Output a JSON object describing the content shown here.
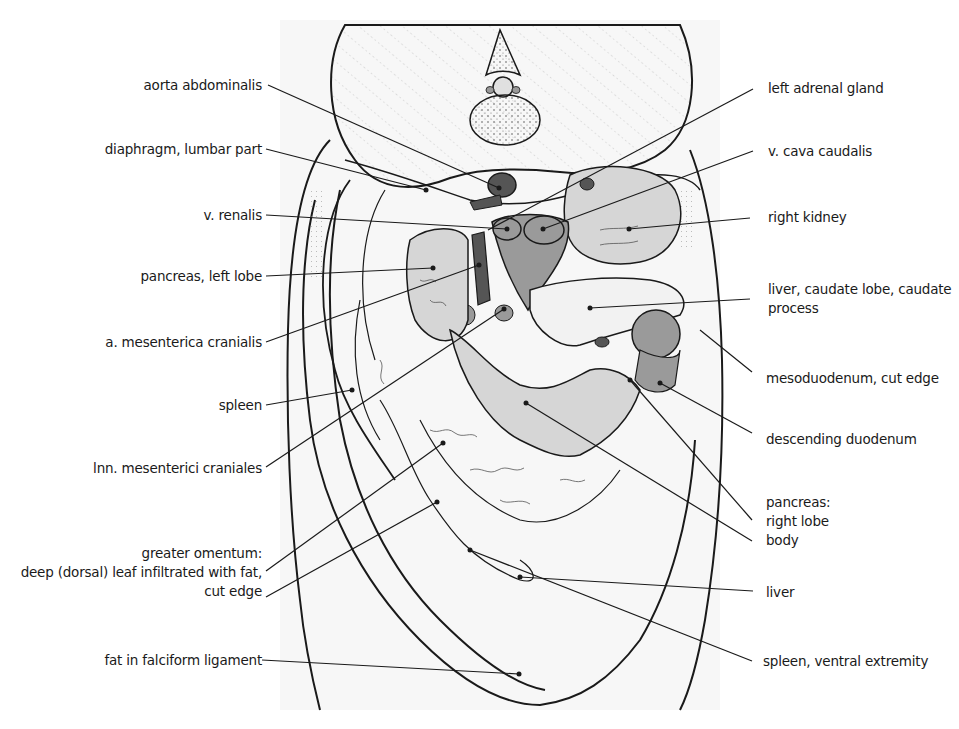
{
  "figure": {
    "type": "anatomical-illustration",
    "colors": {
      "background": "#ffffff",
      "outline": "#1a1a1a",
      "light_organ": "#d6d6d6",
      "mid_organ": "#9a9a9a",
      "dark_vessel": "#555555",
      "leader_line": "#1a1a1a"
    }
  },
  "labels_left": [
    {
      "id": "aorta-abdominalis",
      "lines": [
        "aorta abdominalis"
      ]
    },
    {
      "id": "diaphragm-lumbar-part",
      "lines": [
        "diaphragm, lumbar part"
      ]
    },
    {
      "id": "v-renalis",
      "lines": [
        "v. renalis"
      ]
    },
    {
      "id": "pancreas-left-lobe",
      "lines": [
        "pancreas, left lobe"
      ]
    },
    {
      "id": "a-mesenterica-cranialis",
      "lines": [
        "a. mesenterica cranialis"
      ]
    },
    {
      "id": "spleen",
      "lines": [
        "spleen"
      ]
    },
    {
      "id": "lnn-mesenterici-craniales",
      "lines": [
        "lnn. mesenterici craniales"
      ]
    },
    {
      "id": "greater-omentum",
      "lines": [
        "greater omentum:",
        "deep (dorsal) leaf infiltrated with fat,",
        "cut edge"
      ]
    },
    {
      "id": "fat-in-falciform-ligament",
      "lines": [
        "fat in falciform ligament"
      ]
    }
  ],
  "labels_right": [
    {
      "id": "left-adrenal-gland",
      "lines": [
        "left adrenal gland"
      ]
    },
    {
      "id": "v-cava-caudalis",
      "lines": [
        "v. cava caudalis"
      ]
    },
    {
      "id": "right-kidney",
      "lines": [
        "right kidney"
      ]
    },
    {
      "id": "liver-caudate-lobe",
      "lines": [
        "liver, caudate lobe, caudate",
        "process"
      ]
    },
    {
      "id": "mesoduodenum-cut-edge",
      "lines": [
        "mesoduodenum, cut edge"
      ]
    },
    {
      "id": "descending-duodenum",
      "lines": [
        "descending duodenum"
      ]
    },
    {
      "id": "pancreas-right-lobe-body",
      "lines": [
        "pancreas:",
        "right lobe",
        "body"
      ]
    },
    {
      "id": "liver",
      "lines": [
        "liver"
      ]
    },
    {
      "id": "spleen-ventral-extremity",
      "lines": [
        "spleen, ventral extremity"
      ]
    }
  ]
}
